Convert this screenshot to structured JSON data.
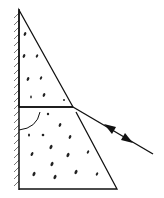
{
  "diagram": {
    "title": "",
    "colors": {
      "background": "#ffffff",
      "stroke": "#111111",
      "hatch": "#555555",
      "speckle": "#222222"
    },
    "elements": {
      "mirror": {
        "label": "mirror",
        "x": 19,
        "y1": 10,
        "y2": 189
      },
      "upper_prism": {
        "label": "upper prism",
        "points": [
          [
            19,
            10
          ],
          [
            73,
            107
          ],
          [
            19,
            107
          ]
        ]
      },
      "lower_block": {
        "label": "lower block",
        "points": [
          [
            19,
            107
          ],
          [
            73,
            107
          ],
          [
            117,
            189
          ],
          [
            19,
            189
          ]
        ]
      },
      "angle_arc": {
        "label": "angle"
      },
      "light_ray": {
        "label": "light ray",
        "from": [
          73,
          107
        ],
        "to": [
          153,
          154
        ],
        "arrows": [
          "toward-interface",
          "away-from-interface"
        ]
      }
    }
  }
}
